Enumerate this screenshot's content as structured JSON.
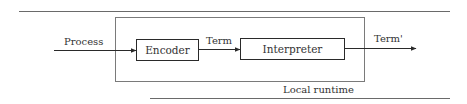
{
  "diagram": {
    "type": "block-flow",
    "container": {
      "label": "Local runtime"
    },
    "nodes": [
      {
        "id": "encoder",
        "label": "Encoder"
      },
      {
        "id": "interpreter",
        "label": "Interpreter"
      }
    ],
    "edges": [
      {
        "from": "external",
        "to": "encoder",
        "label": "Process"
      },
      {
        "from": "encoder",
        "to": "interpreter",
        "label": "Term"
      },
      {
        "from": "interpreter",
        "to": "external",
        "label": "Term'"
      }
    ]
  },
  "colors": {
    "line": "#2a2a2a",
    "container_border": "#7a7a7a",
    "rule": "#6a6a6a",
    "background": "#ffffff"
  }
}
